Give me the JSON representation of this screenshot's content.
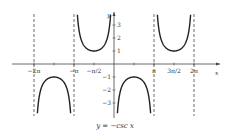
{
  "chart_data": {
    "type": "line",
    "title": "y = −csc x",
    "xlabel": "x",
    "ylabel": "y",
    "x_ticks": [
      {
        "label": "−2π",
        "value": -6.2832
      },
      {
        "label": "−π",
        "value": -3.1416
      },
      {
        "label": "−π/2",
        "value": -1.5708
      },
      {
        "label": "π",
        "value": 3.1416
      },
      {
        "label": "3π/2",
        "value": 4.7124
      },
      {
        "label": "2π",
        "value": 6.2832
      }
    ],
    "y_ticks": [
      1,
      2,
      3,
      -1,
      -2,
      -3
    ],
    "asymptotes": [
      "−2π",
      "−π",
      "0",
      "π",
      "2π"
    ],
    "series": [
      {
        "name": "y = −csc x",
        "function": "-1/sin(x)",
        "domain": [
          -6.2832,
          6.2832
        ]
      }
    ],
    "xlim": [
      -7,
      7.5
    ],
    "ylim": [
      -4,
      4
    ],
    "grid": false,
    "legend": "none",
    "local_extrema": [
      {
        "x": "−3π/2",
        "y": -1
      },
      {
        "x": "−π/2",
        "y": 1
      },
      {
        "x": "π/2",
        "y": -1
      },
      {
        "x": "3π/2",
        "y": 1
      }
    ]
  },
  "caption": "y = −csc x",
  "axis_labels": {
    "x": "x",
    "y": "y"
  }
}
